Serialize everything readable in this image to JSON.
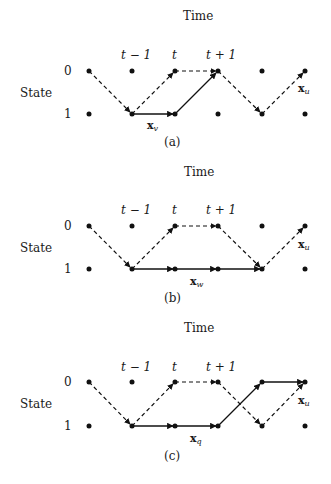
{
  "axis": {
    "time_label": "Time",
    "state_label": "State",
    "time_ticks": [
      "t − 1",
      "t",
      "t + 1"
    ],
    "states": [
      "0",
      "1"
    ]
  },
  "panels": [
    {
      "id": "a",
      "caption": "(a)",
      "path_label_main": "x",
      "path_label_sub": "v",
      "u_label_main": "x",
      "u_label_sub": "u",
      "solid_path": [
        [
          1,
          1
        ],
        [
          2,
          1
        ],
        [
          3,
          0
        ]
      ],
      "dashed_path": [
        [
          0,
          0
        ],
        [
          1,
          1
        ],
        [
          2,
          0
        ],
        [
          3,
          0
        ],
        [
          4,
          1
        ],
        [
          5,
          0
        ]
      ]
    },
    {
      "id": "b",
      "caption": "(b)",
      "path_label_main": "x",
      "path_label_sub": "w",
      "u_label_main": "x",
      "u_label_sub": "u",
      "solid_path": [
        [
          1,
          1
        ],
        [
          2,
          1
        ],
        [
          3,
          1
        ],
        [
          4,
          1
        ]
      ],
      "dashed_path": [
        [
          0,
          0
        ],
        [
          1,
          1
        ],
        [
          2,
          0
        ],
        [
          3,
          0
        ],
        [
          4,
          1
        ],
        [
          5,
          0
        ]
      ]
    },
    {
      "id": "c",
      "caption": "(c)",
      "path_label_main": "x",
      "path_label_sub": "q",
      "u_label_main": "x",
      "u_label_sub": "u",
      "solid_path": [
        [
          1,
          1
        ],
        [
          2,
          1
        ],
        [
          3,
          1
        ],
        [
          4,
          0
        ],
        [
          5,
          0
        ]
      ],
      "dashed_path": [
        [
          0,
          0
        ],
        [
          1,
          1
        ],
        [
          2,
          0
        ],
        [
          3,
          0
        ],
        [
          4,
          1
        ],
        [
          5,
          0
        ]
      ]
    }
  ]
}
